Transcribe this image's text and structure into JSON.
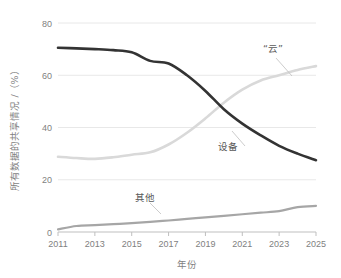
{
  "chart_data": {
    "type": "line",
    "title": "",
    "xlabel": "年份",
    "ylabel": "所有数据的共享情况 /（%）",
    "xlim": [
      2011,
      2025
    ],
    "ylim": [
      0,
      80
    ],
    "grid": true,
    "legend_position": "inline-annotations",
    "x_ticks": [
      "2011",
      "2013",
      "2015",
      "2017",
      "2019",
      "2021",
      "2023",
      "2025"
    ],
    "y_ticks": [
      "0",
      "20",
      "40",
      "60",
      "80"
    ],
    "x": [
      2011,
      2012,
      2013,
      2014,
      2015,
      2016,
      2017,
      2018,
      2019,
      2020,
      2021,
      2022,
      2023,
      2024,
      2025
    ],
    "series": [
      {
        "name": "设备",
        "color": "#333333",
        "values": [
          70.5,
          70.3,
          70.0,
          69.6,
          68.8,
          65.5,
          64.5,
          60.0,
          54.0,
          47.0,
          41.5,
          37.0,
          33.0,
          30.0,
          27.5
        ]
      },
      {
        "name": "“云”",
        "color": "#d9d9d9",
        "values": [
          28.8,
          28.3,
          28.0,
          28.6,
          29.6,
          30.5,
          33.5,
          38.0,
          43.5,
          49.5,
          54.5,
          58.0,
          60.0,
          62.0,
          63.5
        ]
      },
      {
        "name": "其他",
        "color": "#a6a6a6",
        "values": [
          1.0,
          2.3,
          2.6,
          3.0,
          3.4,
          3.9,
          4.4,
          5.0,
          5.6,
          6.2,
          6.8,
          7.4,
          8.0,
          9.5,
          10.0
        ]
      }
    ],
    "annotations": [
      {
        "name": "“云”",
        "label": "“云”"
      },
      {
        "name": "设备",
        "label": "设备"
      },
      {
        "name": "其他",
        "label": "其他"
      }
    ]
  },
  "axes": {
    "y_title": "所有数据的共享情况 /（%）",
    "x_title": "年份"
  },
  "labels": {
    "cloud": "“云”",
    "device": "设备",
    "other": "其他"
  },
  "ticks": {
    "y": [
      "80",
      "60",
      "40",
      "20",
      "0"
    ],
    "x": [
      "2011",
      "2013",
      "2015",
      "2017",
      "2019",
      "2021",
      "2023",
      "2025"
    ]
  },
  "colors": {
    "device": "#333333",
    "cloud": "#d9d9d9",
    "other": "#a6a6a6",
    "grid": "#e8e8e8",
    "axis": "#bfbfbf",
    "text": "#7f7f7f"
  }
}
